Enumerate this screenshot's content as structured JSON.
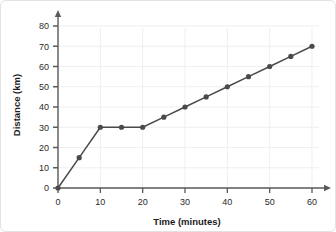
{
  "chart_data": {
    "type": "line",
    "title": "",
    "xlabel": "Time (minutes)",
    "ylabel": "Distance (km)",
    "xlim": [
      0,
      60
    ],
    "ylim": [
      0,
      80
    ],
    "xticks": [
      0,
      10,
      20,
      30,
      40,
      50,
      60
    ],
    "yticks": [
      0,
      10,
      20,
      30,
      40,
      50,
      60,
      70,
      80
    ],
    "xtick_labels": [
      "0",
      "10",
      "20",
      "30",
      "40",
      "50",
      "60"
    ],
    "ytick_labels": [
      "0",
      "10",
      "20",
      "30",
      "40",
      "50",
      "60",
      "70",
      "80"
    ],
    "grid": true,
    "legend": false,
    "legend_position": "none",
    "marker": "circle",
    "line_color": "#4a4a4a",
    "marker_color": "#4a4a4a",
    "grid_color": "#eceff3",
    "axis_color": "#5a5a5a",
    "background_color": "#ffffff",
    "x": [
      0,
      5,
      10,
      15,
      20,
      25,
      30,
      35,
      40,
      45,
      50,
      55,
      60
    ],
    "values": [
      0,
      15,
      30,
      30,
      30,
      35,
      40,
      45,
      50,
      55,
      60,
      65,
      70
    ],
    "series": [
      {
        "name": "Distance travelled",
        "points": [
          {
            "x": 0,
            "y": 0
          },
          {
            "x": 5,
            "y": 15
          },
          {
            "x": 10,
            "y": 30
          },
          {
            "x": 15,
            "y": 30
          },
          {
            "x": 20,
            "y": 30
          },
          {
            "x": 25,
            "y": 35
          },
          {
            "x": 30,
            "y": 40
          },
          {
            "x": 35,
            "y": 45
          },
          {
            "x": 40,
            "y": 50
          },
          {
            "x": 45,
            "y": 55
          },
          {
            "x": 50,
            "y": 60
          },
          {
            "x": 55,
            "y": 65
          },
          {
            "x": 60,
            "y": 70
          }
        ]
      }
    ]
  }
}
